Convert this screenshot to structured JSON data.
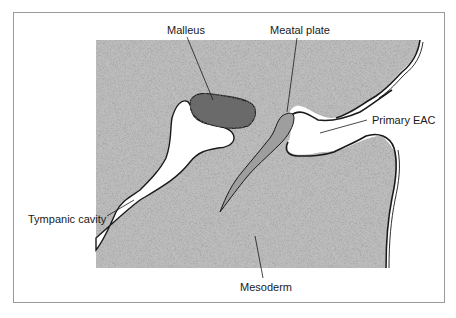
{
  "figure": {
    "frame_color": "#9a9a9a",
    "stipple_color": "#bdbdbd",
    "outline_color": "#1a1a1a",
    "malleus_color": "#6b6b6b",
    "meatal_plate_color": "#9e9e9e",
    "cavity_color": "#ffffff"
  },
  "labels": {
    "malleus": "Malleus",
    "meatal_plate": "Meatal plate",
    "primary_eac": "Primary EAC",
    "tympanic_cavity": "Tympanic cavity",
    "mesoderm": "Mesoderm"
  }
}
